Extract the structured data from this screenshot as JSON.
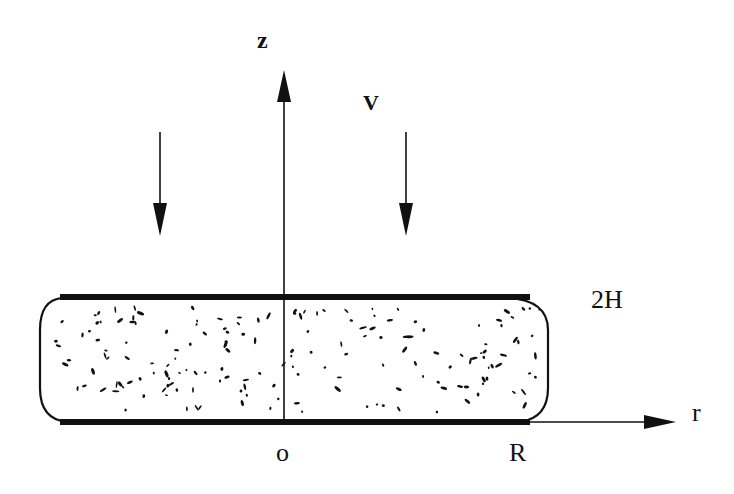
{
  "diagram": {
    "labels": {
      "z_axis": "z",
      "velocity": "V",
      "gap": "2H",
      "r_axis": "r",
      "origin": "o",
      "radius": "R"
    },
    "colors": {
      "ink": "#111111",
      "background": "#ffffff"
    }
  }
}
